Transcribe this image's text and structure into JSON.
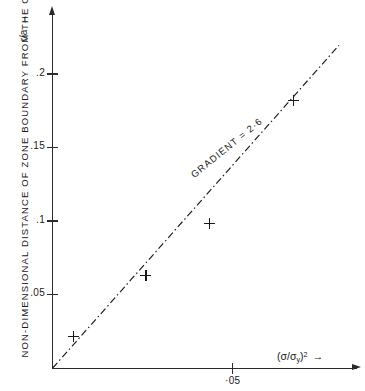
{
  "chart_data": {
    "type": "scatter",
    "title": "",
    "xlabel": "(σ/σy)²",
    "ylabel": "NON-DIMENSIONAL DISTANCE OF ZONE BOUNDARY FROM THE CRACK-TIP",
    "y_symbol": "r/a",
    "x_symbol_base": "(σ/σ",
    "x_symbol_sub": "y",
    "x_symbol_tail": ")",
    "x_symbol_sup": "2",
    "xlim": [
      0,
      0.0845
    ],
    "ylim": [
      0,
      0.2435
    ],
    "grid": false,
    "legend": null,
    "y_ticks": [
      {
        "label": ".2",
        "value": 0.2
      },
      {
        "label": ".15",
        "value": 0.15
      },
      {
        "label": ".1",
        "value": 0.1
      },
      {
        "label": ".05",
        "value": 0.05
      }
    ],
    "x_ticks": [
      {
        "label": "·05",
        "value": 0.05
      }
    ],
    "points": [
      {
        "x": 0.0058,
        "y": 0.0215
      },
      {
        "x": 0.0258,
        "y": 0.063
      },
      {
        "x": 0.0435,
        "y": 0.0985
      },
      {
        "x": 0.0668,
        "y": 0.182
      }
    ],
    "trend_line": {
      "style": "dash-dot",
      "gradient": 2.6,
      "annotation": "GRADIENT = 2·6",
      "start": {
        "x": 0.0,
        "y": 0.0
      },
      "end": {
        "x": 0.0795,
        "y": 0.2195
      }
    }
  },
  "axes": {
    "y_arrow": "↑",
    "x_arrow": "→"
  }
}
